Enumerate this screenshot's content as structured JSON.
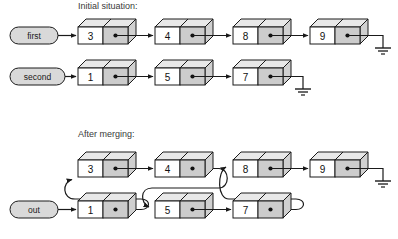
{
  "diagram": {
    "title_initial": "Initial situation:",
    "title_merged": "After merging:",
    "colors": {
      "stroke": "#1a1a1a",
      "cell_value_fill": "#ffffff",
      "cell_pointer_fill": "#cccccc",
      "face_top_fill": "#e8e8e8",
      "face_side_fill": "#d0d0d0",
      "capsule_fill": "#d9d9d9",
      "background": "#ffffff",
      "text": "#1a1a1a",
      "title_text": "#3a3a3a"
    }
  },
  "initial": {
    "label": "Initial situation:",
    "lists": [
      {
        "name": "first",
        "head_label": "first",
        "nodes": [
          {
            "value": "3"
          },
          {
            "value": "4"
          },
          {
            "value": "8"
          },
          {
            "value": "9"
          }
        ],
        "terminator": "ground"
      },
      {
        "name": "second",
        "head_label": "second",
        "nodes": [
          {
            "value": "1"
          },
          {
            "value": "5"
          },
          {
            "value": "7"
          }
        ],
        "terminator": "ground"
      }
    ]
  },
  "merged": {
    "label": "After merging:",
    "head_label": "out",
    "order": [
      "1",
      "3",
      "4",
      "5",
      "7",
      "8",
      "9"
    ],
    "top_row_nodes": [
      {
        "value": "3"
      },
      {
        "value": "4"
      },
      {
        "value": "8"
      },
      {
        "value": "9"
      }
    ],
    "bottom_row_nodes": [
      {
        "value": "1"
      },
      {
        "value": "5"
      },
      {
        "value": "7"
      }
    ],
    "links": [
      {
        "from": "out",
        "to": "1",
        "style": "straight"
      },
      {
        "from": "1",
        "to": "3",
        "style": "curve-up-left"
      },
      {
        "from": "3",
        "to": "4",
        "style": "straight"
      },
      {
        "from": "4",
        "to": "5",
        "style": "curve-down-left"
      },
      {
        "from": "5",
        "to": "7",
        "style": "straight"
      },
      {
        "from": "7",
        "to": "8",
        "style": "curve-up-left"
      },
      {
        "from": "8",
        "to": "9",
        "style": "straight"
      },
      {
        "from": "9",
        "to": "null",
        "style": "ground"
      }
    ],
    "terminator": "ground"
  },
  "icons": {
    "ground": "ground-icon",
    "arrow": "arrow-head-icon",
    "pointer_dot": "pointer-dot-icon"
  }
}
